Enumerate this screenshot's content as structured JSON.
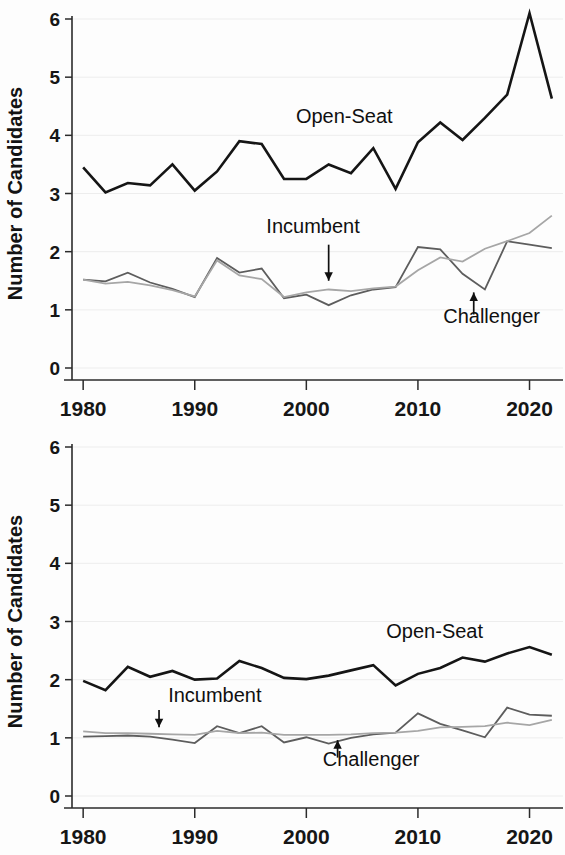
{
  "figure": {
    "background": "#fdfdfd",
    "panel_count": 2
  },
  "chart_data": [
    {
      "id": "top-panel",
      "type": "line",
      "title": "",
      "xlabel": "",
      "ylabel": "Number of Candidates",
      "xlim": [
        1979,
        2023
      ],
      "ylim": [
        0,
        6.4
      ],
      "xticks": [
        1980,
        1990,
        2000,
        2010,
        2020
      ],
      "xticklabels": [
        "1980",
        "1990",
        "2000",
        "2010",
        "2020"
      ],
      "yticks": [
        0,
        1,
        2,
        3,
        4,
        5,
        6
      ],
      "yticklabels": [
        "0",
        "1",
        "2",
        "3",
        "4",
        "5",
        "6"
      ],
      "grid": true,
      "legend": "inline-annotations",
      "x": [
        1980,
        1982,
        1984,
        1986,
        1988,
        1990,
        1992,
        1994,
        1996,
        1998,
        2000,
        2002,
        2004,
        2006,
        2008,
        2010,
        2012,
        2014,
        2016,
        2018,
        2020,
        2022
      ],
      "series": [
        {
          "name": "Open-Seat",
          "color": "#151515",
          "width": 2.6,
          "values": [
            3.45,
            3.02,
            3.18,
            3.14,
            3.5,
            3.05,
            3.38,
            3.9,
            3.85,
            3.25,
            3.25,
            3.5,
            3.35,
            3.78,
            3.08,
            3.88,
            4.22,
            3.92,
            4.3,
            4.7,
            6.1,
            4.63
          ]
        },
        {
          "name": "Challenger",
          "color": "#5d5d5d",
          "width": 1.8,
          "values": [
            1.52,
            1.49,
            1.64,
            1.47,
            1.36,
            1.22,
            1.89,
            1.64,
            1.71,
            1.2,
            1.26,
            1.08,
            1.25,
            1.35,
            1.39,
            2.08,
            2.04,
            1.62,
            1.35,
            2.18,
            2.12,
            2.06
          ]
        },
        {
          "name": "Incumbent",
          "color": "#a6a6a6",
          "width": 1.8,
          "values": [
            1.52,
            1.45,
            1.48,
            1.42,
            1.34,
            1.23,
            1.85,
            1.59,
            1.53,
            1.22,
            1.3,
            1.35,
            1.32,
            1.37,
            1.4,
            1.68,
            1.9,
            1.83,
            2.05,
            2.18,
            2.32,
            2.62
          ]
        }
      ],
      "annotations": [
        {
          "id": "open-seat-label",
          "text": "Open-Seat",
          "x": 2003.4,
          "y": 4.22,
          "anchor": "middle",
          "arrow": null
        },
        {
          "id": "incumbent-label",
          "text": "Incumbent",
          "x": 2000.6,
          "y": 2.32,
          "anchor": "middle",
          "arrow": {
            "from_y": 2.12,
            "to_y": 1.5,
            "x": 2002.0,
            "direction": "down"
          }
        },
        {
          "id": "challenger-label",
          "text": "Challenger",
          "x": 2016.6,
          "y": 0.78,
          "anchor": "middle",
          "arrow": {
            "from_y": 0.92,
            "to_y": 1.3,
            "x": 2015.0,
            "direction": "up"
          }
        }
      ]
    },
    {
      "id": "bottom-panel",
      "type": "line",
      "title": "",
      "xlabel": "",
      "ylabel": "Number of Candidates",
      "xlim": [
        1979,
        2023
      ],
      "ylim": [
        0,
        6.4
      ],
      "xticks": [
        1980,
        1990,
        2000,
        2010,
        2020
      ],
      "xticklabels": [
        "1980",
        "1990",
        "2000",
        "2010",
        "2020"
      ],
      "yticks": [
        0,
        1,
        2,
        3,
        4,
        5,
        6
      ],
      "yticklabels": [
        "0",
        "1",
        "2",
        "3",
        "4",
        "5",
        "6"
      ],
      "grid": true,
      "legend": "inline-annotations",
      "x": [
        1980,
        1982,
        1984,
        1986,
        1988,
        1990,
        1992,
        1994,
        1996,
        1998,
        2000,
        2002,
        2004,
        2006,
        2008,
        2010,
        2012,
        2014,
        2016,
        2018,
        2020,
        2022
      ],
      "series": [
        {
          "name": "Open-Seat",
          "color": "#151515",
          "width": 2.6,
          "values": [
            1.98,
            1.82,
            2.22,
            2.05,
            2.15,
            2.0,
            2.02,
            2.32,
            2.2,
            2.03,
            2.01,
            2.07,
            2.16,
            2.25,
            1.9,
            2.1,
            2.2,
            2.38,
            2.31,
            2.45,
            2.56,
            2.43
          ]
        },
        {
          "name": "Challenger",
          "color": "#5d5d5d",
          "width": 1.8,
          "values": [
            1.02,
            1.03,
            1.04,
            1.02,
            0.97,
            0.91,
            1.2,
            1.08,
            1.2,
            0.92,
            1.01,
            0.9,
            1.0,
            1.06,
            1.09,
            1.42,
            1.24,
            1.13,
            1.01,
            1.52,
            1.4,
            1.38
          ]
        },
        {
          "name": "Incumbent",
          "color": "#a6a6a6",
          "width": 1.8,
          "values": [
            1.11,
            1.08,
            1.08,
            1.07,
            1.06,
            1.05,
            1.12,
            1.08,
            1.09,
            1.05,
            1.05,
            1.05,
            1.06,
            1.08,
            1.09,
            1.12,
            1.18,
            1.19,
            1.2,
            1.26,
            1.22,
            1.31
          ]
        }
      ],
      "annotations": [
        {
          "id": "open-seat-label",
          "text": "Open-Seat",
          "x": 2011.5,
          "y": 2.72,
          "anchor": "middle",
          "arrow": null
        },
        {
          "id": "incumbent-label",
          "text": "Incumbent",
          "x": 1991.8,
          "y": 1.62,
          "anchor": "middle",
          "arrow": {
            "from_y": 1.48,
            "to_y": 1.18,
            "x": 1986.8,
            "direction": "down"
          }
        },
        {
          "id": "challenger-label",
          "text": "Challenger",
          "x": 2005.8,
          "y": 0.52,
          "anchor": "middle",
          "arrow": {
            "from_y": 0.66,
            "to_y": 0.96,
            "x": 2002.8,
            "direction": "up"
          }
        }
      ]
    }
  ]
}
